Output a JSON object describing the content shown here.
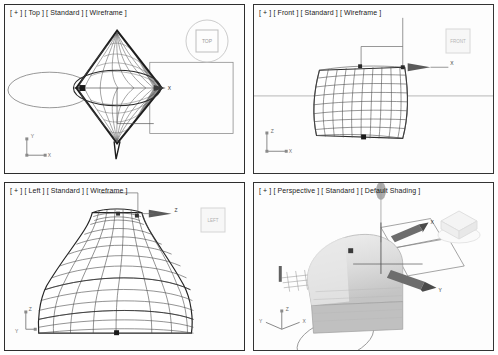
{
  "app": {
    "name": "3D modeling application",
    "layout": "four-viewport-quad",
    "background_color": "#ffffff",
    "border_color": "#2e2e2e",
    "wire_color": "#444444",
    "accent_color": "#1a1a1a"
  },
  "viewports": [
    {
      "id": "top",
      "label": "[ + ] [ Top ] [ Standard ] [ Wireframe ]",
      "plus_token": "[ + ]",
      "view_token": "[ Top ]",
      "preset_token": "[ Standard ]",
      "shading_token": "[ Wireframe ]",
      "view_name": "Top",
      "shading": "Wireframe",
      "preset": "Standard",
      "axis_tripod": {
        "up_label": "Y",
        "right_label": "X",
        "origin_label": ""
      },
      "gizmo": {
        "type": "move-gizmo",
        "axis_labels": [
          "X"
        ]
      },
      "viewcube": {
        "style": "circle-top",
        "face_label": "TOP"
      },
      "shapes": [
        "diamond-lathe-mesh",
        "ellipse-shape",
        "selection-rectangle"
      ]
    },
    {
      "id": "front",
      "label": "[ + ] [ Front ] [ Standard ] [ Wireframe ]",
      "plus_token": "[ + ]",
      "view_token": "[ Front ]",
      "preset_token": "[ Standard ]",
      "shading_token": "[ Wireframe ]",
      "view_name": "Front",
      "shading": "Wireframe",
      "preset": "Standard",
      "axis_tripod": {
        "up_label": "Z",
        "right_label": "X",
        "origin_label": ""
      },
      "gizmo": {
        "type": "move-gizmo",
        "axis_labels": [
          "X"
        ]
      },
      "viewcube": {
        "style": "square-flat",
        "face_label": "FRONT"
      },
      "shapes": [
        "barrel-wireframe-grid",
        "horizon-line"
      ]
    },
    {
      "id": "left",
      "label": "[ + ] [ Left ] [ Standard ] [ Wireframe ]",
      "plus_token": "[ + ]",
      "view_token": "[ Left ]",
      "preset_token": "[ Standard ]",
      "shading_token": "[ Wireframe ]",
      "view_name": "Left",
      "shading": "Wireframe",
      "preset": "Standard",
      "axis_tripod": {
        "up_label": "Z",
        "right_label": "Y",
        "origin_label": ""
      },
      "gizmo": {
        "type": "move-gizmo",
        "axis_labels": [
          "Z"
        ]
      },
      "viewcube": {
        "style": "square-flat",
        "face_label": "LEFT"
      },
      "shapes": [
        "vase-lathe-wireframe"
      ]
    },
    {
      "id": "perspective",
      "label": "[ + ] [ Perspective ] [ Standard ] [ Default Shading ]",
      "plus_token": "[ + ]",
      "view_token": "[ Perspective ]",
      "preset_token": "[ Standard ]",
      "shading_token": "[ Default Shading ]",
      "view_name": "Perspective",
      "shading": "Default Shading",
      "preset": "Standard",
      "axis_tripod": {
        "up_label": "Z",
        "right_label": "X",
        "origin_label": "Y"
      },
      "gizmo": {
        "type": "move-gizmo",
        "axis_labels": [
          "X",
          "Y"
        ]
      },
      "viewcube": {
        "style": "cube-3d",
        "face_label": ""
      },
      "shapes": [
        "shaded-solid",
        "ellipse-shape",
        "plane-grid"
      ]
    }
  ]
}
